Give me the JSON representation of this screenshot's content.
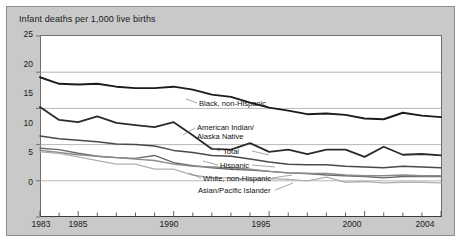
{
  "chart_data": {
    "type": "line",
    "title": "Infant deaths per 1,000 live births",
    "xlabel": "",
    "ylabel": "",
    "ylim": [
      0,
      25
    ],
    "xlim": [
      1983,
      2004
    ],
    "yticks": [
      0,
      5,
      10,
      15,
      20,
      25
    ],
    "xticks": [
      1983,
      1984,
      1985,
      1986,
      1987,
      1988,
      1989,
      1990,
      1991,
      1992,
      1993,
      1994,
      1995,
      1996,
      1997,
      1998,
      1999,
      2000,
      2001,
      2002,
      2003,
      2004
    ],
    "xtick_labels": [
      "1983",
      "1985",
      "1990",
      "1995",
      "2000",
      "2004"
    ],
    "xtick_label_years": [
      1983,
      1985,
      1990,
      1995,
      2000,
      2004
    ],
    "grid": "horizontal",
    "legend": "inline-labels",
    "x": [
      1983,
      1984,
      1985,
      1986,
      1987,
      1988,
      1989,
      1990,
      1991,
      1992,
      1993,
      1994,
      1995,
      1996,
      1997,
      1998,
      1999,
      2000,
      2001,
      2002,
      2003,
      2004
    ],
    "series": [
      {
        "name": "Black, non-Hispanic",
        "label": "Black, non-Hispanic",
        "color": "#1c1c1c",
        "values": [
          19.3,
          18.4,
          18.3,
          18.4,
          18.0,
          17.8,
          17.8,
          18.0,
          17.6,
          16.9,
          16.6,
          15.8,
          15.1,
          14.7,
          14.2,
          14.3,
          14.1,
          13.6,
          13.5,
          14.4,
          14.0,
          13.8
        ]
      },
      {
        "name": "American Indian/Alaska Native",
        "label": "American Indian/ Alaska Native",
        "label_line1": "American Indian/",
        "label_line2": "Alaska Native",
        "color": "#2b2b2b",
        "values": [
          15.2,
          13.4,
          13.1,
          13.9,
          13.0,
          12.7,
          12.4,
          13.1,
          11.3,
          9.4,
          9.3,
          10.2,
          9.0,
          9.3,
          8.7,
          9.3,
          9.3,
          8.3,
          9.7,
          8.6,
          8.7,
          8.5
        ]
      },
      {
        "name": "Total",
        "label": "Total",
        "color": "#4a4a4a",
        "values": [
          11.2,
          10.8,
          10.6,
          10.4,
          10.1,
          10.0,
          9.8,
          9.2,
          8.9,
          8.5,
          8.4,
          8.0,
          7.6,
          7.3,
          7.2,
          7.2,
          7.0,
          6.9,
          6.8,
          7.0,
          6.9,
          6.8
        ]
      },
      {
        "name": "Hispanic",
        "label": "Hispanic",
        "color": "#6b6b6b",
        "values": [
          9.5,
          9.3,
          8.8,
          8.4,
          8.2,
          8.1,
          8.5,
          7.5,
          7.1,
          6.8,
          6.6,
          6.5,
          6.3,
          6.1,
          6.0,
          5.8,
          5.7,
          5.6,
          5.4,
          5.6,
          5.6,
          5.6
        ]
      },
      {
        "name": "White, non-Hispanic",
        "label": "White, non-Hispanic",
        "color": "#8a8a8a",
        "values": [
          9.2,
          8.9,
          8.6,
          8.4,
          8.2,
          8.0,
          7.8,
          7.3,
          7.0,
          6.9,
          6.8,
          6.6,
          6.3,
          6.1,
          6.0,
          6.0,
          5.8,
          5.7,
          5.7,
          5.8,
          5.7,
          5.7
        ]
      },
      {
        "name": "Asian/Pacific Islander",
        "label": "Asian/Pacific Islander",
        "color": "#b0b0b0",
        "values": [
          9.0,
          8.8,
          8.3,
          7.8,
          7.3,
          7.3,
          6.6,
          6.6,
          5.8,
          5.4,
          5.4,
          5.2,
          5.3,
          5.2,
          5.0,
          5.5,
          4.8,
          4.9,
          4.7,
          4.8,
          4.8,
          4.7
        ]
      }
    ]
  },
  "axis": {
    "y_labels": [
      "25",
      "20",
      "15",
      "10",
      "5",
      "0"
    ],
    "x_labels": [
      "1983",
      "1985",
      "1990",
      "1995",
      "2000",
      "2004"
    ]
  }
}
